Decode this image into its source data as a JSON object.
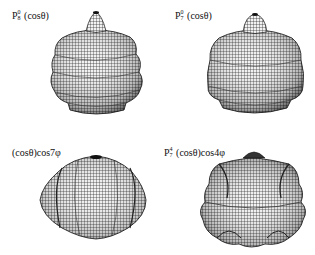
{
  "figure": {
    "panels": [
      {
        "id": "p1",
        "label": {
          "base": "P",
          "sup": "0",
          "sub": "8",
          "arg": "(cosθ)",
          "extra": ""
        },
        "shape": "axisymmetric-ribbed-bulb",
        "description": "Zonal spherical harmonic P_8^0(cosθ) surface plot"
      },
      {
        "id": "p2",
        "label": {
          "base": "P",
          "sup": "0",
          "sub": "7",
          "arg": "(cosθ)",
          "extra": ""
        },
        "shape": "axisymmetric-ribbed-bulb",
        "description": "Zonal spherical harmonic P_7^0(cosθ) surface plot"
      },
      {
        "id": "p3",
        "label": {
          "base": "",
          "sup": "",
          "sub": "",
          "arg": "(cosθ)",
          "extra": "cos7φ"
        },
        "shape": "sectoral-lobed-ellipsoid",
        "description": "Sectoral harmonic (cosθ)cos7φ surface plot"
      },
      {
        "id": "p4",
        "label": {
          "base": "P",
          "sup": "4",
          "sub": "7",
          "arg": "(cosθ)",
          "extra": "cos4φ"
        },
        "shape": "tesseral-star-lobed",
        "description": "Tesseral harmonic P_7^4(cosθ)cos4φ surface plot"
      }
    ],
    "colors": {
      "mesh": "#1a1a1a",
      "fill": "#f4f4f4",
      "background": "#ffffff"
    }
  }
}
